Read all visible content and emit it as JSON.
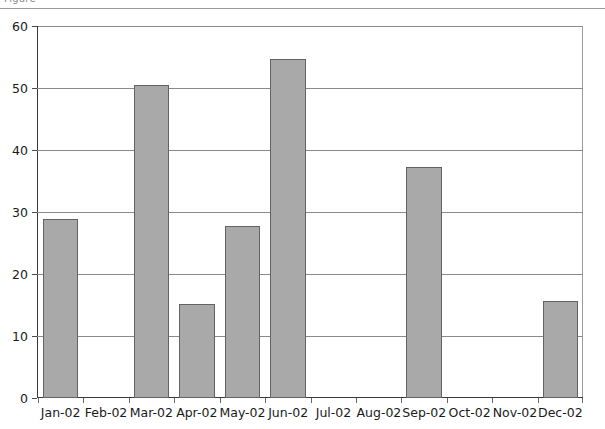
{
  "figure": {
    "caption_fragment": "Figure"
  },
  "chart_data": {
    "type": "bar",
    "title": "",
    "subtitle": "",
    "xlabel": "",
    "ylabel": "",
    "categories": [
      "Jan-02",
      "Feb-02",
      "Mar-02",
      "Apr-02",
      "May-02",
      "Jun-02",
      "Jul-02",
      "Aug-02",
      "Sep-02",
      "Oct-02",
      "Nov-02",
      "Dec-02"
    ],
    "values": [
      28.8,
      0,
      50.5,
      15.2,
      27.8,
      54.6,
      0,
      0,
      37.2,
      0,
      0,
      15.6
    ],
    "series": [
      {
        "name": "Series 1",
        "values": [
          28.8,
          0,
          50.5,
          15.2,
          27.8,
          54.6,
          0,
          0,
          37.2,
          0,
          0,
          15.6
        ]
      }
    ],
    "ylim": [
      0,
      60
    ],
    "yticks": [
      0,
      10,
      20,
      30,
      40,
      50,
      60
    ],
    "ytick_labels": [
      "0",
      "10",
      "20",
      "30",
      "40",
      "50",
      "60"
    ],
    "grid": true,
    "grid_axis": "y",
    "legend": false,
    "legend_position": "none",
    "bar_fill_color": "#a9a9a9",
    "bar_edge_color": "#636363",
    "gridline_color": "#8a8a8a",
    "axis_color": "#3a3a3a",
    "background_color": "#ffffff"
  }
}
